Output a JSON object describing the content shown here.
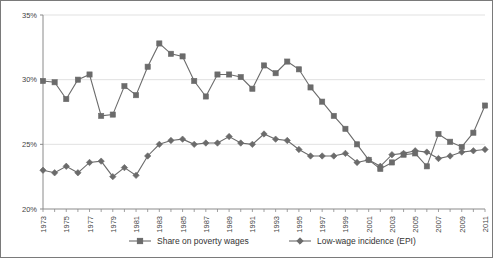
{
  "chart_data": {
    "type": "line",
    "title": "",
    "subtitle": "",
    "xlabel": "",
    "ylabel": "",
    "ylim": [
      20,
      35
    ],
    "yticks": [
      20,
      25,
      30,
      35
    ],
    "ytick_labels": [
      "20%",
      "25%",
      "30%",
      "35%"
    ],
    "grid": true,
    "grid_axis": "y",
    "legend_position": "bottom",
    "x": [
      1973,
      1974,
      1975,
      1976,
      1977,
      1978,
      1979,
      1980,
      1981,
      1982,
      1983,
      1984,
      1985,
      1986,
      1987,
      1988,
      1989,
      1990,
      1991,
      1992,
      1993,
      1994,
      1995,
      1996,
      1997,
      1998,
      1999,
      2000,
      2001,
      2002,
      2003,
      2004,
      2005,
      2006,
      2007,
      2008,
      2009,
      2010,
      2011
    ],
    "xtick_labels": [
      "1973",
      "1975",
      "1977",
      "1979",
      "1981",
      "1983",
      "1985",
      "1987",
      "1989",
      "1991",
      "1993",
      "1995",
      "1997",
      "1999",
      "2001",
      "2003",
      "2005",
      "2007",
      "2009",
      "2011"
    ],
    "xtick_step": 2,
    "series": [
      {
        "name": "Share on poverty wages",
        "marker": "square",
        "color": "#6b6b6b",
        "values": [
          29.9,
          29.8,
          28.5,
          30.0,
          30.4,
          27.2,
          27.3,
          29.5,
          28.8,
          31.0,
          32.8,
          32.0,
          31.8,
          29.9,
          28.7,
          30.4,
          30.4,
          30.2,
          29.3,
          31.1,
          30.5,
          31.4,
          30.8,
          29.4,
          28.3,
          27.2,
          26.2,
          25.0,
          23.8,
          23.1,
          23.6,
          24.2,
          24.3,
          23.3,
          25.8,
          25.2,
          24.8,
          25.9,
          28.0
        ]
      },
      {
        "name": "Low-wage incidence (EPI)",
        "marker": "diamond",
        "color": "#6b6b6b",
        "values": [
          23.0,
          22.8,
          23.3,
          22.8,
          23.6,
          23.7,
          22.5,
          23.2,
          22.6,
          24.1,
          25.0,
          25.3,
          25.4,
          25.0,
          25.1,
          25.1,
          25.6,
          25.1,
          25.0,
          25.8,
          25.4,
          25.3,
          24.6,
          24.1,
          24.1,
          24.1,
          24.3,
          23.6,
          23.8,
          23.3,
          24.2,
          24.3,
          24.5,
          24.4,
          23.9,
          24.1,
          24.4,
          24.5,
          24.6
        ]
      }
    ]
  },
  "legend": {
    "items": [
      {
        "label": "Share on poverty wages"
      },
      {
        "label": "Low-wage incidence (EPI)"
      }
    ]
  }
}
